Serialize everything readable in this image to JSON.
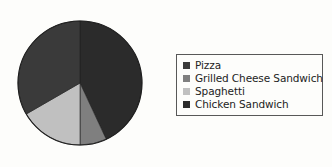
{
  "chart_data": {
    "type": "pie",
    "title": "",
    "categories": [
      "Pizza",
      "Grilled Cheese Sandwich",
      "Spaghetti",
      "Chicken Sandwich"
    ],
    "values": [
      33,
      7,
      17,
      43
    ],
    "units": "percent",
    "legend_position": "right",
    "grid": false,
    "start_angle_deg": 0,
    "direction": "clockwise",
    "slices": [
      {
        "label": "Pizza",
        "value": 33,
        "color": "#3a3a3a",
        "start_deg": 240,
        "end_deg": 360
      },
      {
        "label": "Grilled Cheese Sandwich",
        "value": 7,
        "color": "#7f7f7f",
        "start_deg": 155,
        "end_deg": 180
      },
      {
        "label": "Spaghetti",
        "value": 17,
        "color": "#c0c0c0",
        "start_deg": 180,
        "end_deg": 240
      },
      {
        "label": "Chicken Sandwich",
        "value": 43,
        "color": "#2b2b2b",
        "start_deg": 0,
        "end_deg": 155
      }
    ]
  },
  "legend": {
    "items": [
      {
        "label": "Pizza",
        "color": "#3a3a3a",
        "swatch_icon": "square-swatch-icon"
      },
      {
        "label": "Grilled Cheese Sandwich",
        "color": "#7f7f7f",
        "swatch_icon": "square-swatch-icon"
      },
      {
        "label": "Spaghetti",
        "color": "#c0c0c0",
        "swatch_icon": "square-swatch-icon"
      },
      {
        "label": "Chicken Sandwich",
        "color": "#2b2b2b",
        "swatch_icon": "square-swatch-icon"
      }
    ]
  },
  "style": {
    "background": "#fdfdfb",
    "outline": "#1e1e1e",
    "legend_border": "#585858",
    "text": "#232323"
  }
}
